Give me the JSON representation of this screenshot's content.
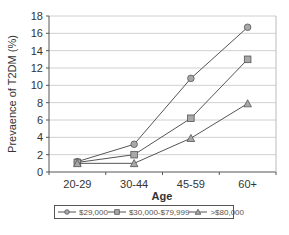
{
  "chart_data": {
    "type": "line",
    "title": "",
    "xlabel": "Age",
    "ylabel": "Prevaence of T2DM (%)",
    "categories": [
      "20-29",
      "30-44",
      "45-59",
      "60+"
    ],
    "ylim": [
      0,
      18
    ],
    "yticks": [
      0,
      2,
      4,
      6,
      8,
      10,
      12,
      14,
      16,
      18
    ],
    "grid": true,
    "legend_position": "bottom",
    "series": [
      {
        "name": "$29,000",
        "marker": "circle",
        "values": [
          1.2,
          3.2,
          10.8,
          16.7
        ]
      },
      {
        "name": "$30,000-$79,999",
        "marker": "square",
        "values": [
          1.1,
          2.0,
          6.2,
          13.0
        ]
      },
      {
        "name": ">$80,000",
        "marker": "triangle",
        "values": [
          1.0,
          1.0,
          3.9,
          7.9
        ]
      }
    ],
    "colors": {
      "line": "#555555",
      "marker_fill": "#a8a8a8",
      "grid": "#d0d0d0",
      "axis": "#555555"
    }
  },
  "legend": {
    "items": [
      {
        "label": "$29,000",
        "marker": "circle"
      },
      {
        "label": "$30,000-$79,999",
        "marker": "square"
      },
      {
        "label": ">$80,000",
        "marker": "triangle"
      }
    ]
  }
}
